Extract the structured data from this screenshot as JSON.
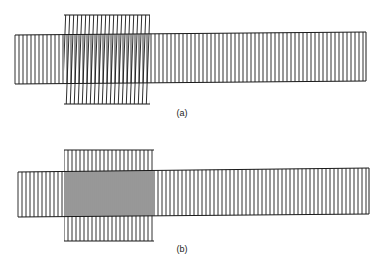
{
  "figure": {
    "stroke_color": "#1a1a1a",
    "line_spacing": 4,
    "panels": [
      {
        "id": "a",
        "caption": "(a)",
        "caption_pos": {
          "x": 182,
          "y": 108
        },
        "band": {
          "x1": 15,
          "x2": 366,
          "y_top_left": 35,
          "y_top_right": 32,
          "y_bot_left": 84,
          "y_bot_right": 81
        },
        "overlay": {
          "x1": 64,
          "x2": 150,
          "y1": 15,
          "y2": 104,
          "tilt_deg": 2.2,
          "aligned": false
        }
      },
      {
        "id": "b",
        "caption": "(b)",
        "caption_pos": {
          "x": 182,
          "y": 244
        },
        "band": {
          "x1": 18,
          "x2": 369,
          "y_top_left": 172,
          "y_top_right": 168,
          "y_bot_left": 217,
          "y_bot_right": 214
        },
        "overlay": {
          "x1": 64,
          "x2": 154,
          "y1": 150,
          "y2": 241,
          "tilt_deg": 0,
          "aligned": true
        }
      }
    ]
  }
}
